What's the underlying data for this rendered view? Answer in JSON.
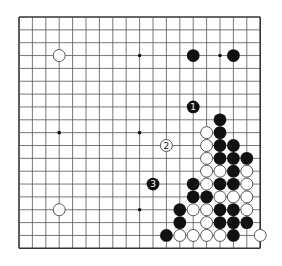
{
  "board": {
    "size": 19,
    "origin_x": 19,
    "origin_y": 17,
    "spacing_x": 13.4,
    "spacing_y": 12.85,
    "stone_radius": 6.4,
    "colors": {
      "line": "#555555",
      "border": "#333333",
      "black_stone": "#111111",
      "white_stone": "#ffffff",
      "white_stone_stroke": "#444444",
      "background": "#ffffff"
    },
    "star_points": [
      [
        3,
        3
      ],
      [
        9,
        3
      ],
      [
        15,
        3
      ],
      [
        3,
        9
      ],
      [
        9,
        9
      ],
      [
        15,
        9
      ],
      [
        3,
        15
      ],
      [
        9,
        15
      ],
      [
        15,
        15
      ]
    ]
  },
  "stones": {
    "black": [
      [
        13,
        3
      ],
      [
        16,
        3
      ],
      [
        15,
        8
      ],
      [
        15,
        9
      ],
      [
        15,
        10
      ],
      [
        16,
        10
      ],
      [
        15,
        11
      ],
      [
        16,
        11
      ],
      [
        17,
        11
      ],
      [
        16,
        12
      ],
      [
        13,
        13
      ],
      [
        15,
        13
      ],
      [
        16,
        13
      ],
      [
        13,
        14
      ],
      [
        14,
        14
      ],
      [
        12,
        15
      ],
      [
        15,
        15
      ],
      [
        16,
        15
      ],
      [
        12,
        16
      ],
      [
        15,
        16
      ],
      [
        16,
        16
      ],
      [
        17,
        16
      ],
      [
        11,
        17
      ],
      [
        16,
        17
      ]
    ],
    "white": [
      [
        3,
        3
      ],
      [
        3,
        15
      ],
      [
        14,
        9
      ],
      [
        14,
        10
      ],
      [
        14,
        11
      ],
      [
        14,
        12
      ],
      [
        15,
        12
      ],
      [
        17,
        12
      ],
      [
        14,
        13
      ],
      [
        17,
        13
      ],
      [
        15,
        14
      ],
      [
        16,
        14
      ],
      [
        17,
        14
      ],
      [
        13,
        15
      ],
      [
        14,
        15
      ],
      [
        17,
        15
      ],
      [
        14,
        16
      ],
      [
        12,
        17
      ],
      [
        13,
        17
      ],
      [
        14,
        17
      ],
      [
        15,
        17
      ],
      [
        18,
        17
      ]
    ]
  },
  "moves": [
    {
      "number": "1",
      "color": "black",
      "x": 13,
      "y": 7
    },
    {
      "number": "2",
      "color": "white",
      "x": 11,
      "y": 10
    },
    {
      "number": "3",
      "color": "black",
      "x": 10,
      "y": 13
    }
  ]
}
